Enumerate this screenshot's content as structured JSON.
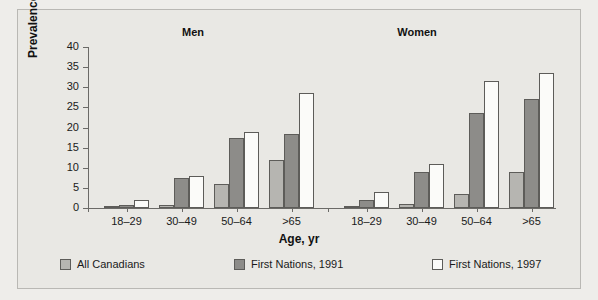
{
  "figure": {
    "panels": [
      {
        "name": "men",
        "title": "Men"
      },
      {
        "name": "women",
        "title": "Women"
      }
    ],
    "legend_labels": [
      "All Canadians",
      "First Nations, 1991",
      "First Nations, 1997"
    ]
  },
  "chart_data": {
    "type": "bar",
    "title": "",
    "xlabel": "Age, yr",
    "ylabel": "Prevalence, %",
    "ylim": [
      0,
      40
    ],
    "yticks": [
      0,
      5,
      10,
      15,
      20,
      25,
      30,
      35,
      40
    ],
    "grid": false,
    "legend_position": "bottom",
    "panel_titles": [
      "Men",
      "Women"
    ],
    "categories": [
      "18–29",
      "30–49",
      "50–64",
      ">65",
      "18–29",
      "30–49",
      "50–64",
      ">65"
    ],
    "panels": [
      {
        "name": "Men",
        "categories": [
          "18–29",
          "30–49",
          "50–64",
          ">65"
        ],
        "series": [
          {
            "name": "All Canadians",
            "color": "#b6b5b1",
            "values": [
              0.3,
              0.7,
              6.0,
              12.0
            ]
          },
          {
            "name": "First Nations, 1991",
            "color": "#8d8c89",
            "values": [
              0.7,
              7.5,
              17.5,
              18.5
            ]
          },
          {
            "name": "First Nations, 1997",
            "color": "#fbfbf9",
            "values": [
              2.0,
              8.0,
              19.0,
              28.5
            ]
          }
        ]
      },
      {
        "name": "Women",
        "categories": [
          "18–29",
          "30–49",
          "50–64",
          ">65"
        ],
        "series": [
          {
            "name": "All Canadians",
            "color": "#b6b5b1",
            "values": [
              0.3,
              1.0,
              3.5,
              9.0
            ]
          },
          {
            "name": "First Nations, 1991",
            "color": "#8d8c89",
            "values": [
              2.0,
              9.0,
              23.5,
              27.0
            ]
          },
          {
            "name": "First Nations, 1997",
            "color": "#fbfbf9",
            "values": [
              4.0,
              11.0,
              31.5,
              33.5
            ]
          }
        ]
      }
    ],
    "series_names": [
      "All Canadians",
      "First Nations, 1991",
      "First Nations, 1997"
    ],
    "colors": {
      "all_canadians": "#b6b5b1",
      "first_nations_1991": "#8d8c89",
      "first_nations_1997": "#fbfbf9"
    }
  }
}
